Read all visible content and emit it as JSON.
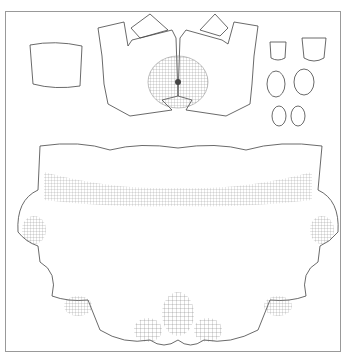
{
  "figure": {
    "type": "uv-texture-layout",
    "colors": {
      "background": "#ffffff",
      "wire": "#555555",
      "border": "#999999"
    },
    "islands": [
      {
        "name": "small-square-patch",
        "position": "top-left"
      },
      {
        "name": "upper-torso-chest",
        "position": "top-center"
      },
      {
        "name": "shoulder-piece-left",
        "position": "top-center-left"
      },
      {
        "name": "shoulder-piece-right",
        "position": "top-center-right"
      },
      {
        "name": "small-parts-group",
        "position": "top-right",
        "count": 6
      },
      {
        "name": "lower-body-main",
        "position": "bottom"
      }
    ]
  }
}
